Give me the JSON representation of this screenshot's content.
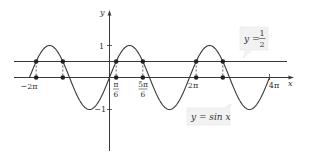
{
  "chart_data": {
    "type": "line",
    "title": "",
    "xlabel": "x",
    "ylabel": "y",
    "xlim": [
      -6.283,
      12.566
    ],
    "ylim": [
      -1,
      1
    ],
    "grid": false,
    "legend_position": "annotations",
    "series": [
      {
        "name": "y = sin x",
        "function": "sin(x)",
        "x_range": [
          -6.283,
          12.566
        ]
      },
      {
        "name": "y = 1/2",
        "function": "0.5",
        "x_range": [
          -6.9,
          11.9
        ]
      }
    ],
    "x_ticks": [
      {
        "value": -6.283,
        "label": "−2π"
      },
      {
        "value": 0.5236,
        "label_num": "π",
        "label_den": "6"
      },
      {
        "value": 2.618,
        "label_num": "5π",
        "label_den": "6"
      },
      {
        "value": 6.283,
        "label": "2π"
      },
      {
        "value": 12.566,
        "label": "4π"
      }
    ],
    "y_ticks": [
      {
        "value": 1,
        "label": "1"
      },
      {
        "value": -1,
        "label": "−1"
      }
    ],
    "intersection_points_x": [
      -5.76,
      -3.665,
      0.5236,
      2.618,
      6.807,
      8.901
    ],
    "intersection_y": 0.5,
    "annotations": [
      {
        "text": "y = sin x"
      },
      {
        "text_prefix": "y =",
        "frac_num": "1",
        "frac_den": "2"
      }
    ]
  },
  "labels": {
    "x_axis": "x",
    "y_axis": "y",
    "tick_neg2pi": "−2π",
    "tick_pi6_num": "π",
    "tick_pi6_den": "6",
    "tick_5pi6_num": "5π",
    "tick_5pi6_den": "6",
    "tick_2pi": "2π",
    "tick_4pi": "4π",
    "tick_y1": "1",
    "tick_yneg1": "−1",
    "sin_label": "y = sin x",
    "half_prefix": "y =",
    "half_num": "1",
    "half_den": "2"
  }
}
